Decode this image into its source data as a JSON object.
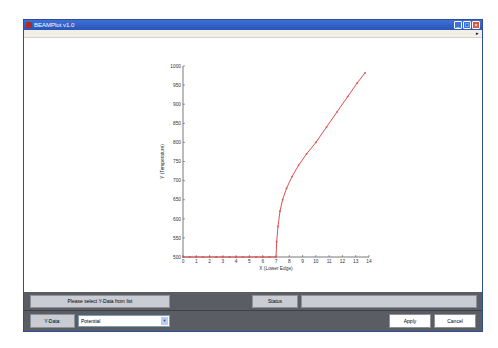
{
  "window": {
    "title": "BEAMPlot v1.0",
    "controls": [
      "minimize",
      "maximize",
      "close"
    ]
  },
  "menubar": {
    "items": [
      {
        "label": "File"
      },
      {
        "label": "Axes"
      },
      {
        "label": "Curves"
      },
      {
        "label": "Return to BEAM"
      }
    ]
  },
  "chart_data": {
    "type": "line",
    "title": "",
    "xlabel": "X (Lower Edge)",
    "ylabel": "Y (Temperature)",
    "xlim": [
      0,
      14
    ],
    "ylim": [
      500,
      1000
    ],
    "x_ticks": [
      "0",
      "1",
      "2",
      "3",
      "4",
      "5",
      "6",
      "7",
      "8",
      "9",
      "10",
      "11",
      "12",
      "13",
      "14"
    ],
    "y_ticks": [
      "500",
      "550",
      "600",
      "650",
      "700",
      "750",
      "800",
      "850",
      "900",
      "950",
      "1000"
    ],
    "grid": false,
    "legend": null,
    "series": [
      {
        "name": "curve",
        "color": "#e05050",
        "marker": "dot",
        "x": [
          0,
          0.5,
          1,
          1.5,
          2,
          2.5,
          3,
          3.5,
          4,
          4.5,
          5,
          5.5,
          6,
          6.5,
          7,
          7.05,
          7.15,
          7.3,
          7.5,
          7.8,
          8.2,
          8.7,
          9.3,
          10,
          10.8,
          11.6,
          12.4,
          13.1,
          13.7
        ],
        "y": [
          500,
          500,
          500,
          500,
          500,
          500,
          500,
          500,
          500,
          500,
          500,
          500,
          500,
          500,
          500,
          540,
          580,
          620,
          650,
          680,
          710,
          740,
          770,
          800,
          840,
          880,
          920,
          955,
          982
        ]
      }
    ]
  },
  "status_row": {
    "message": "Please select Y-Data from list",
    "status_label": "Status",
    "status_value": ""
  },
  "controls_row": {
    "ydata_label": "Y-Data:",
    "ydata_selected": "Potential",
    "apply_label": "Apply",
    "cancel_label": "Cancel"
  }
}
